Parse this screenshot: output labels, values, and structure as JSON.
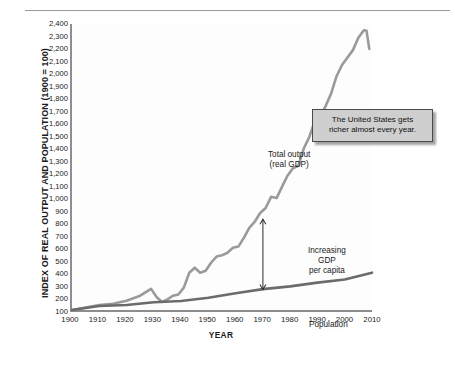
{
  "chart_data": {
    "type": "line",
    "title": "",
    "xlabel": "YEAR",
    "ylabel": "INDEX OF REAL OUTPUT AND POPULATION (1900 = 100)",
    "xlim": [
      1900,
      2010
    ],
    "ylim": [
      100,
      2400
    ],
    "grid": false,
    "legend_position": "inline-annotations",
    "x_ticks": [
      "1900",
      "1910",
      "1920",
      "1930",
      "1940",
      "1950",
      "1960",
      "1970",
      "1980",
      "1990",
      "2000",
      "2010"
    ],
    "y_ticks": [
      "100",
      "200",
      "300",
      "400",
      "500",
      "600",
      "700",
      "800",
      "900",
      "1,000",
      "1,100",
      "1,200",
      "1,300",
      "1,400",
      "1,500",
      "1,600",
      "1,700",
      "1,800",
      "1,900",
      "2,000",
      "2,100",
      "2,200",
      "2,300",
      "2,400"
    ],
    "series": [
      {
        "name": "Total output (real GDP)",
        "color": "#9a9a9a",
        "x": [
          1900,
          1905,
          1910,
          1915,
          1920,
          1925,
          1929,
          1931,
          1933,
          1935,
          1937,
          1939,
          1941,
          1943,
          1945,
          1947,
          1949,
          1951,
          1953,
          1955,
          1957,
          1959,
          1961,
          1963,
          1965,
          1967,
          1969,
          1971,
          1973,
          1975,
          1977,
          1979,
          1981,
          1983,
          1985,
          1987,
          1989,
          1991,
          1993,
          1995,
          1997,
          1999,
          2001,
          2003,
          2005,
          2007,
          2008,
          2009
        ],
        "y": [
          100,
          120,
          140,
          150,
          175,
          215,
          270,
          205,
          165,
          185,
          215,
          225,
          280,
          400,
          440,
          400,
          415,
          480,
          530,
          540,
          560,
          600,
          610,
          680,
          760,
          810,
          880,
          920,
          1010,
          1000,
          1090,
          1180,
          1240,
          1260,
          1400,
          1490,
          1620,
          1660,
          1740,
          1840,
          1980,
          2070,
          2130,
          2190,
          2290,
          2350,
          2345,
          2200
        ]
      },
      {
        "name": "Population",
        "color": "#6b6b6b",
        "x": [
          1900,
          1910,
          1920,
          1930,
          1940,
          1950,
          1960,
          1970,
          1980,
          1990,
          2000,
          2010
        ],
        "y": [
          100,
          132,
          140,
          162,
          172,
          198,
          235,
          268,
          290,
          320,
          345,
          400
        ]
      }
    ],
    "annotations": [
      {
        "id": "total-output",
        "text_lines": [
          "Total output",
          "(real GDP)"
        ],
        "at_x": 1955,
        "at_y": 1400
      },
      {
        "id": "increasing-gdp-per-capita",
        "text_lines": [
          "Increasing",
          "GDP",
          "per capita"
        ],
        "at_x": 1972,
        "at_y": 560
      },
      {
        "id": "population",
        "text_lines": [
          "Population"
        ],
        "at_x": 1972,
        "at_y": 210
      }
    ],
    "arrow": {
      "id": "gdp-per-capita-arrow",
      "x": 1970,
      "y_top": 830,
      "y_bottom": 265,
      "double_headed": true
    }
  },
  "axes": {
    "y_title": "INDEX OF REAL OUTPUT AND POPULATION (1900 = 100)",
    "x_title": "YEAR"
  },
  "annotations": {
    "total_output_line1": "Total output",
    "total_output_line2": "(real GDP)",
    "gdp_pc_line1": "Increasing",
    "gdp_pc_line2": "GDP",
    "gdp_pc_line3": "per capita",
    "population": "Population"
  },
  "callout": {
    "line1": "The United States gets",
    "line2": "richer almost every year."
  },
  "colors": {
    "gdp_line": "#9a9a9a",
    "population_line": "#6b6b6b",
    "axis": "#8d8d8d",
    "callout_fill": "#cfcfcf",
    "callout_border": "#4a4a4a"
  }
}
